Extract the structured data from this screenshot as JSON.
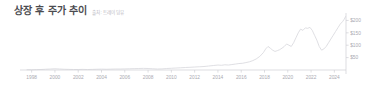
{
  "header": {
    "title": "상장 후 주가 추이",
    "source": "출처: 트레이딩뷰"
  },
  "colors": {
    "background": "#ffffff",
    "title": "#4b4b4f",
    "source": "#b9b9bf",
    "axis": "#cfcfd4",
    "tick_label": "#a9a9b0",
    "series": "#d9d9de"
  },
  "chart_data": {
    "type": "line",
    "title": "상장 후 주가 추이",
    "subtitle": "출처: 트레이딩뷰",
    "xlabel": "",
    "ylabel": "",
    "grid": false,
    "legend": "none",
    "y_axis_position": "right",
    "xlim": [
      1997.0,
      2025.0
    ],
    "ylim": [
      0,
      230
    ],
    "xticks": [
      1998,
      2000,
      2002,
      2004,
      2006,
      2008,
      2010,
      2012,
      2014,
      2016,
      2018,
      2020,
      2022,
      2024
    ],
    "xtick_labels": [
      "1998",
      "2000",
      "2002",
      "2004",
      "2006",
      "2008",
      "2010",
      "2012",
      "2014",
      "2016",
      "2018",
      "2020",
      "2022",
      "2024"
    ],
    "yticks": [
      50,
      100,
      150,
      200
    ],
    "ytick_labels": [
      "$50",
      "$100",
      "$150",
      "$200"
    ],
    "series": [
      {
        "name": "주가",
        "x": [
          1997.6,
          1998.0,
          1998.4,
          1998.8,
          1999.2,
          1999.6,
          2000.0,
          2000.4,
          2000.8,
          2001.2,
          2001.6,
          2002.0,
          2002.4,
          2002.8,
          2003.2,
          2003.6,
          2004.0,
          2004.4,
          2004.8,
          2005.2,
          2005.6,
          2006.0,
          2006.4,
          2006.8,
          2007.2,
          2007.6,
          2008.0,
          2008.4,
          2008.8,
          2009.2,
          2009.6,
          2010.0,
          2010.4,
          2010.8,
          2011.2,
          2011.6,
          2012.0,
          2012.4,
          2012.8,
          2013.2,
          2013.6,
          2014.0,
          2014.3,
          2014.6,
          2014.9,
          2015.2,
          2015.5,
          2015.8,
          2016.1,
          2016.4,
          2016.7,
          2017.0,
          2017.3,
          2017.6,
          2017.9,
          2018.1,
          2018.3,
          2018.5,
          2018.7,
          2018.9,
          2019.1,
          2019.3,
          2019.5,
          2019.7,
          2019.9,
          2020.1,
          2020.3,
          2020.5,
          2020.7,
          2020.9,
          2021.1,
          2021.3,
          2021.5,
          2021.7,
          2021.9,
          2022.1,
          2022.3,
          2022.5,
          2022.7,
          2022.9,
          2023.1,
          2023.3,
          2023.5,
          2023.7,
          2023.9,
          2024.1,
          2024.3,
          2024.5,
          2024.7,
          2024.85,
          2024.95
        ],
        "y": [
          1,
          1,
          1.5,
          2,
          3,
          4,
          5,
          4,
          3,
          2.5,
          2,
          2,
          2.5,
          2,
          2.5,
          3,
          3.5,
          3,
          3.5,
          4,
          4,
          4.5,
          5,
          5.5,
          6,
          6.5,
          6,
          5,
          4,
          4.5,
          6,
          7,
          8,
          9,
          10,
          11,
          12,
          13,
          14,
          16,
          18,
          20,
          19,
          21,
          20,
          22,
          24,
          26,
          27,
          30,
          33,
          38,
          45,
          55,
          70,
          85,
          95,
          88,
          80,
          75,
          78,
          82,
          88,
          95,
          105,
          100,
          95,
          110,
          130,
          150,
          165,
          160,
          170,
          168,
          172,
          160,
          140,
          120,
          95,
          80,
          85,
          95,
          110,
          125,
          140,
          155,
          170,
          185,
          195,
          205,
          215
        ]
      }
    ],
    "annotations": [
      {
        "text": "2018 local peak",
        "x": 2018.3,
        "y": 95
      },
      {
        "text": "2021 plateau",
        "x": 2021.5,
        "y": 172
      },
      {
        "text": "2022 trough",
        "x": 2022.9,
        "y": 80
      },
      {
        "text": "2024 high",
        "x": 2024.95,
        "y": 215
      }
    ]
  }
}
